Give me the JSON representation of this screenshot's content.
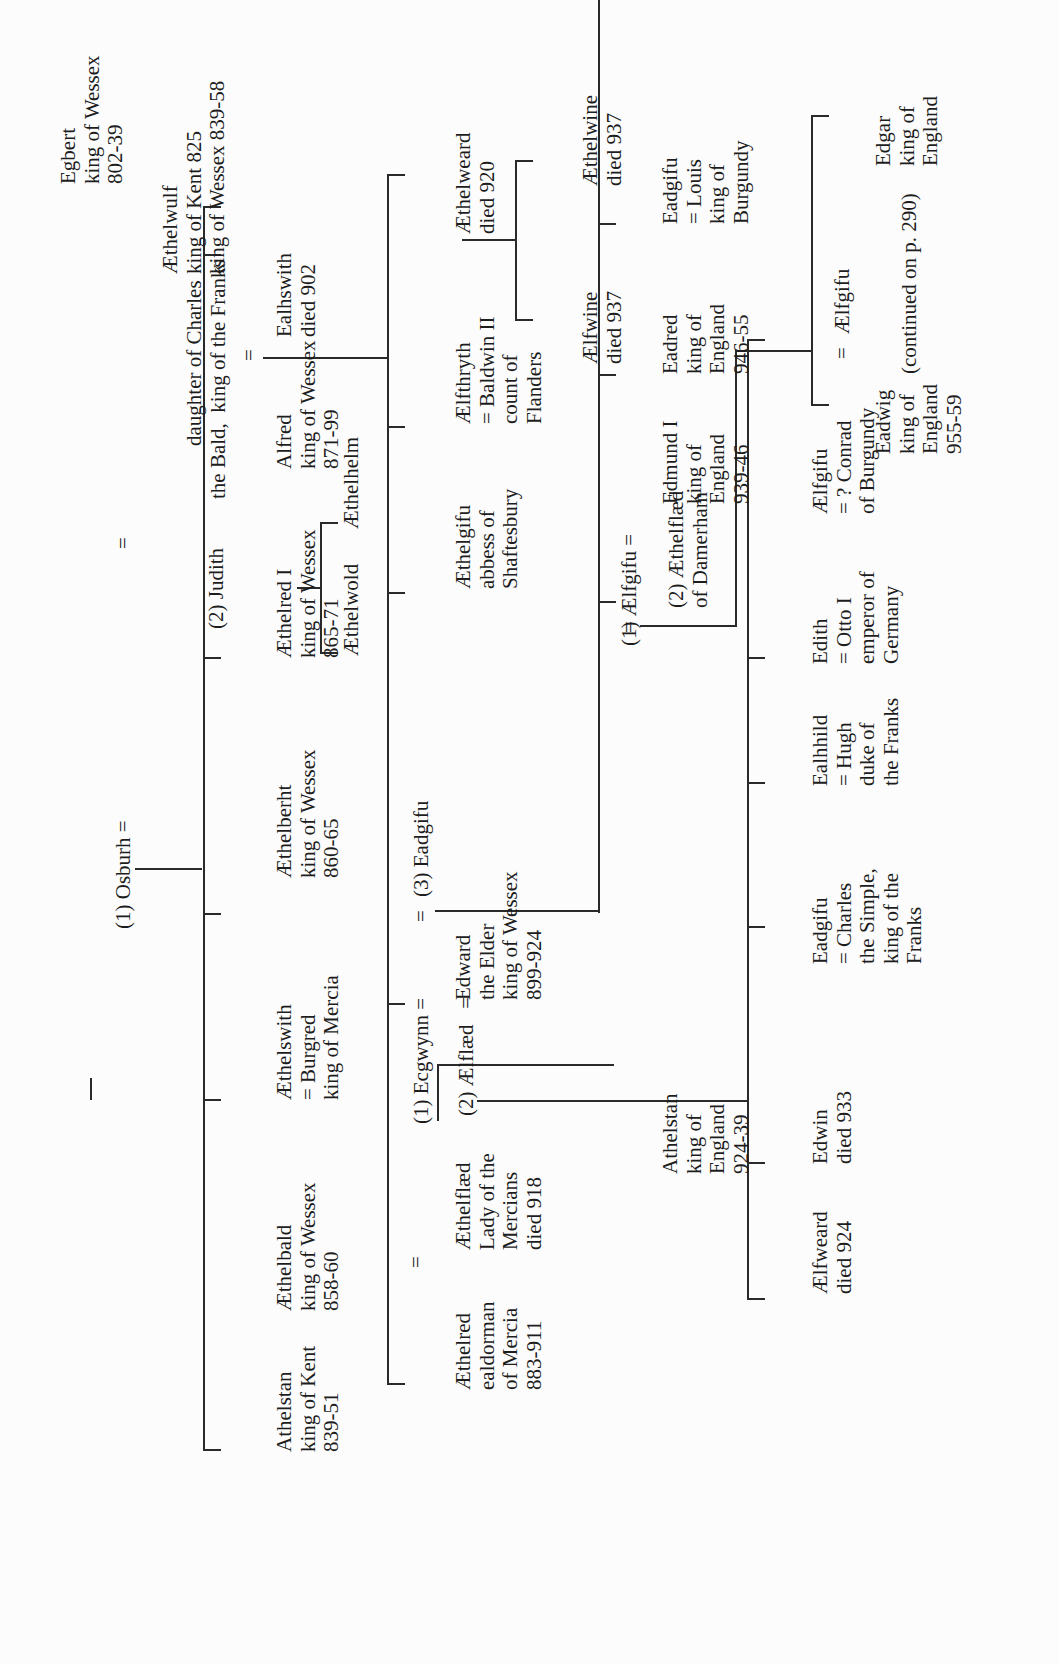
{
  "diagram": {
    "type": "genealogy-tree",
    "orientation": "rotated-90-ccw",
    "continuation_note": "(continued on p. 290)",
    "people": {
      "egbert": [
        "Egbert",
        "king of Wessex",
        "802-39"
      ],
      "osburh": [
        "(1) Osburh ="
      ],
      "aethelwulf": [
        "Æthelwulf",
        "king of Kent 825",
        "king of Wessex 839-58"
      ],
      "judith_eq": "=",
      "judith": [
        "(2) Judith",
        "daughter of Charles",
        "the Bald,  king of the Franks"
      ],
      "athelstan_kent": [
        "Athelstan",
        "king of Kent",
        "839-51"
      ],
      "aethelbald": [
        "Æthelbald",
        "king of Wessex",
        "858-60"
      ],
      "aethelswith": [
        "Æthelswith",
        "= Burgred",
        "king of Mercia"
      ],
      "aethelberht": [
        "Æthelberht",
        "king of Wessex",
        "860-65"
      ],
      "aethelred_i": [
        "Æthelred I",
        "king of Wessex",
        "865-71"
      ],
      "alfred": [
        "Alfred",
        "king of Wessex",
        "871-99"
      ],
      "ealhswith_eq": "=",
      "ealhswith": [
        "Ealhswith",
        "died 902"
      ],
      "aethelwold": [
        "Æthelwold"
      ],
      "aethelhelm": [
        "Æthelhelm"
      ],
      "aethelred_mercia": [
        "Æthelred",
        "ealdorman",
        "of Mercia",
        "883-911"
      ],
      "aethelflaed_eq": "=",
      "aethelflaed": [
        "Æthelflæd",
        "Lady of the",
        "Mercians",
        "died 918"
      ],
      "ecgwynn": [
        "(1) Ecgwynn ="
      ],
      "aelfflaed": [
        "(2) Ælflæd   ="
      ],
      "edward": [
        "Edward",
        "the Elder",
        "king of Wessex",
        "899-924"
      ],
      "eadgifu_3_eq": "=",
      "eadgifu_3": [
        "(3) Eadgifu"
      ],
      "aethelgifu": [
        "Æthelgifu",
        "abbess of",
        "Shaftesbury"
      ],
      "aelfthryth": [
        "Ælfthryth",
        "= Baldwin II",
        "count of",
        "Flanders"
      ],
      "aethelweard": [
        "Æthelweard",
        "died 920"
      ],
      "aelfwine": [
        "Ælfwine",
        "died 937"
      ],
      "aethelwine": [
        "Æthelwine",
        "died 937"
      ],
      "athelstan_england": [
        "Athelstan",
        "king of",
        "England",
        "924-39"
      ],
      "aelfweard": [
        "Ælfweard",
        "died 924"
      ],
      "edwin": [
        "Edwin",
        "died 933"
      ],
      "eadgifu_charles": [
        "Eadgifu",
        "= Charles",
        "the Simple,",
        "king of the",
        "Franks"
      ],
      "ealhhild": [
        "Ealhhild",
        "= Hugh",
        "duke of",
        "the Franks"
      ],
      "edith": [
        "Edith",
        "= Otto I",
        "emperor of",
        "Germany"
      ],
      "aelfgifu_conrad": [
        "Ælfgifu",
        "= ? Conrad",
        "of Burgundy"
      ],
      "aelfgifu_1": [
        "(1) Ælfgifu ="
      ],
      "edmund": [
        "Edmund I",
        "king of",
        "England",
        "939-46"
      ],
      "aethelflaed_damerham_eq": "=",
      "aethelflaed_damerham": [
        "(2) Æthelflæd",
        "of Damerham"
      ],
      "eadred": [
        "Eadred",
        "king of",
        "England",
        "946-55"
      ],
      "eadgifu_louis": [
        "Eadgifu",
        "= Louis",
        "king of",
        "Burgundy"
      ],
      "eadwig": [
        "Eadwig",
        "king of",
        "England",
        "955-59"
      ],
      "eadwig_eq": "=",
      "aelfgifu_eadwig": [
        "Ælfgifu"
      ],
      "edgar": [
        "Edgar",
        "king of",
        "England"
      ]
    }
  }
}
